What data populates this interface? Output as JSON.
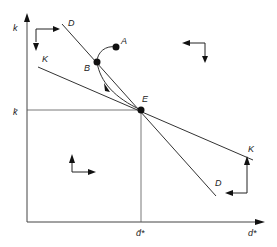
{
  "diagram": {
    "axes": {
      "y_label": "k",
      "x_label": "d*",
      "y_marker_label": "k̄",
      "x_marker_label": "d̄*"
    },
    "curves": {
      "D_label_top": "D",
      "D_label_bottom": "D",
      "K_label_left": "K",
      "K_label_right": "K"
    },
    "points": {
      "A": "A",
      "B": "B",
      "E": "E"
    },
    "colors": {
      "line": "#333333",
      "point": "#111111"
    }
  }
}
